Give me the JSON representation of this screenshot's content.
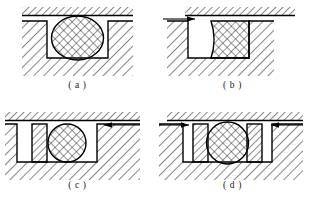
{
  "figure": {
    "panel_count": 4,
    "background_color": "#ffffff",
    "line_color": "#000000",
    "hatch_color": "#1a1a1a",
    "arrow_color": "#000000"
  },
  "panels": [
    {
      "id": "a",
      "caption": "( a )",
      "description": "O-ring seated in rectangular groove, no pressure applied, no back-up ring",
      "seal": {
        "kind": "o-ring",
        "shape": "circular",
        "fill": "cross-hatch"
      },
      "backup_rings": 0,
      "pressure_arrows": []
    },
    {
      "id": "b",
      "caption": "( b )",
      "description": "Seal extruded and deformed against groove wall under pressure, no back-up ring",
      "seal": {
        "kind": "o-ring",
        "shape": "extruded-rectangular",
        "fill": "cross-hatch"
      },
      "backup_rings": 0,
      "pressure_arrows": [
        {
          "side": "left",
          "direction": "right"
        }
      ]
    },
    {
      "id": "c",
      "caption": "( c )",
      "description": "O-ring with single back-up ring on the low-pressure side, pressure from the right",
      "seal": {
        "kind": "o-ring",
        "shape": "circular",
        "fill": "cross-hatch"
      },
      "backup_rings": 1,
      "pressure_arrows": [
        {
          "side": "right",
          "direction": "left"
        }
      ]
    },
    {
      "id": "d",
      "caption": "( d )",
      "description": "O-ring with two back-up rings, pressure acting from both sides",
      "seal": {
        "kind": "o-ring",
        "shape": "circular",
        "fill": "cross-hatch"
      },
      "backup_rings": 2,
      "pressure_arrows": [
        {
          "side": "left",
          "direction": "right"
        },
        {
          "side": "right",
          "direction": "left"
        }
      ]
    }
  ]
}
